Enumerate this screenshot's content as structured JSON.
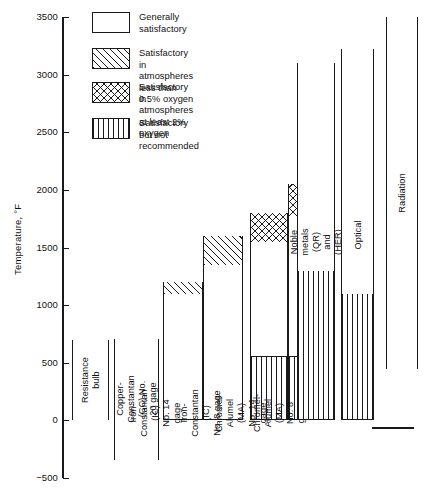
{
  "axis": {
    "y_title": "Temperature, °F",
    "ticks": [
      "3500",
      "3000",
      "2500",
      "2000",
      "1500",
      "1000",
      "500",
      "0",
      "-500"
    ],
    "min": -500,
    "max": 3500,
    "step": 500
  },
  "legend": {
    "items": [
      {
        "key": "generally-satisfactory",
        "pattern": "plain",
        "label": "Generally satisfactory"
      },
      {
        "key": "low-oxygen",
        "pattern": "diag",
        "label": "Satisfactory in atmospheres\n  less than 0.5% oxygen"
      },
      {
        "key": "high-oxygen",
        "pattern": "cross",
        "label": "Satisfactory in atmospheres\n    at least 2% oxygen"
      },
      {
        "key": "not-recommended",
        "pattern": "vert",
        "label": "Satisfactory but not\n    recommended"
      }
    ]
  },
  "chart_data": {
    "type": "bar",
    "title": "",
    "xlabel": "",
    "ylabel": "Temperature, °F",
    "ylim": [
      -500,
      3500
    ],
    "grid": false,
    "legend_position": "top-right",
    "units": "°F",
    "note": "Floating range bars: each bar spans a usable temperature range, subdivided by suitability pattern.",
    "categories": [
      "Resistance bulb",
      "Copper-Constantan (CC) No. 20 gage",
      "Iron-Constantan (IC) No. 14 gage",
      "Iron-Constantan (IC) No. 8 gage",
      "Chromel-Alumel (MA) No. 14 gage",
      "Chromel-Alumel (MA) No. 8 gage",
      "Noble metals (QR) and (HER)",
      "Optical",
      "Radiation"
    ],
    "bars": [
      {
        "name": "Resistance bulb",
        "label": "Resistance bulb",
        "low": 0,
        "high": 700,
        "segments": [
          {
            "from": 0,
            "to": 700,
            "pattern": "plain"
          }
        ]
      },
      {
        "name": "Copper-Constantan (CC) No. 20 gage",
        "label": "Copper-Constantan\n(CC) No. 20 gage",
        "low": -340,
        "high": 710,
        "segments": [
          {
            "from": -340,
            "to": 710,
            "pattern": "plain"
          }
        ]
      },
      {
        "name": "Iron-Constantan (IC) No. 14 gage",
        "label": "Iron-Constantan (IC)\nNo. 14 gage",
        "low": 0,
        "high": 1200,
        "segments": [
          {
            "from": 0,
            "to": 1100,
            "pattern": "plain"
          },
          {
            "from": 1100,
            "to": 1200,
            "pattern": "diag"
          }
        ]
      },
      {
        "name": "Iron-Constantan (IC) No. 8 gage",
        "label": "Iron-Constantan (IC)\nNo. 8 gage",
        "low": 0,
        "high": 1600,
        "segments": [
          {
            "from": 0,
            "to": 1350,
            "pattern": "plain"
          },
          {
            "from": 1350,
            "to": 1600,
            "pattern": "diag"
          }
        ]
      },
      {
        "name": "Chromel-Alumel (MA) No. 14 gage",
        "label": "Chromel-Alumel (MA)\nNo. 14 gage",
        "low": 0,
        "high": 1800,
        "segments": [
          {
            "from": 0,
            "to": 550,
            "pattern": "vert"
          },
          {
            "from": 550,
            "to": 1550,
            "pattern": "plain"
          },
          {
            "from": 1550,
            "to": 1800,
            "pattern": "cross"
          }
        ]
      },
      {
        "name": "Chromel-Alumel (MA) No. 8 gage",
        "label": "Chromel-Alumel (MA)\nNo. 8 gage",
        "low": 0,
        "high": 2050,
        "segments": [
          {
            "from": 0,
            "to": 550,
            "pattern": "vert"
          },
          {
            "from": 550,
            "to": 1775,
            "pattern": "plain"
          },
          {
            "from": 1775,
            "to": 2050,
            "pattern": "cross"
          }
        ]
      },
      {
        "name": "Noble metals (QR) and (HER)",
        "label": "Noble metals (QR) and (HER)",
        "low": 0,
        "high": 3100,
        "segments": [
          {
            "from": 0,
            "to": 1300,
            "pattern": "vert"
          },
          {
            "from": 1300,
            "to": 3100,
            "pattern": "plain"
          }
        ]
      },
      {
        "name": "Optical",
        "label": "Optical",
        "low": 0,
        "high": 3220,
        "segments": [
          {
            "from": 0,
            "to": 1100,
            "pattern": "vert"
          },
          {
            "from": 1100,
            "to": 3220,
            "pattern": "plain"
          }
        ]
      },
      {
        "name": "Radiation",
        "label": "Radiation",
        "low": 450,
        "high": 3500,
        "segments": [
          {
            "from": 450,
            "to": 3500,
            "pattern": "plain"
          }
        ]
      }
    ]
  },
  "geometry": {
    "axis_x": 62,
    "y_top_px": 17,
    "y_bottom_px": 478,
    "bars_px": [
      {
        "x": 72,
        "w": 36
      },
      {
        "x": 114,
        "w": 44
      },
      {
        "x": 162,
        "w": 40
      },
      {
        "x": 202,
        "w": 40
      },
      {
        "x": 249,
        "w": 37
      },
      {
        "x": 286,
        "w": 37
      },
      {
        "x": 295,
        "w": 0
      },
      {
        "x": 0,
        "w": 0
      },
      {
        "x": 0,
        "w": 0
      }
    ]
  }
}
